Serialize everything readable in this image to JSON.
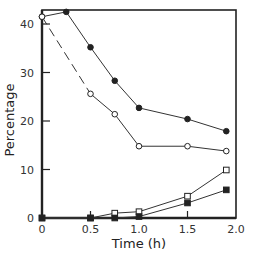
{
  "chart_data": {
    "type": "line",
    "title": "",
    "xlabel": "Time (h)",
    "ylabel": "Percentage",
    "xlim": [
      0,
      2.0
    ],
    "ylim": [
      0,
      43
    ],
    "xticks": [
      0,
      0.5,
      1.0,
      1.5,
      2.0
    ],
    "xtick_labels": [
      "0",
      "0.5",
      "1.0",
      "1.5",
      "2.0"
    ],
    "yticks": [
      0,
      10,
      20,
      30,
      40
    ],
    "ytick_labels": [
      "0",
      "10",
      "20",
      "30",
      "40"
    ],
    "grid": false,
    "legend": null,
    "series": [
      {
        "name": "filled-circles",
        "marker": "filled-circle",
        "line": "solid",
        "x": [
          0,
          0.25,
          0.5,
          0.75,
          1.0,
          1.5,
          1.9
        ],
        "y": [
          41.5,
          42.5,
          35.2,
          28.3,
          22.7,
          20.4,
          17.9
        ]
      },
      {
        "name": "open-circles",
        "marker": "open-circle",
        "line": "dashed-then-solid",
        "dashed_until_x": 0.5,
        "x": [
          0,
          0.5,
          0.75,
          1.0,
          1.5,
          1.9
        ],
        "y": [
          41.5,
          25.6,
          21.4,
          14.8,
          14.8,
          13.8
        ]
      },
      {
        "name": "open-squares",
        "marker": "open-square",
        "line": "solid",
        "x": [
          0,
          0.5,
          0.75,
          1.0,
          1.5,
          1.9
        ],
        "y": [
          0,
          0,
          1.0,
          1.3,
          4.5,
          9.9
        ]
      },
      {
        "name": "filled-squares",
        "marker": "filled-square",
        "line": "solid",
        "x": [
          0,
          0.5,
          0.75,
          1.0,
          1.5,
          1.9
        ],
        "y": [
          0,
          0,
          0,
          0.3,
          3.1,
          5.8
        ]
      }
    ]
  },
  "labels": {
    "xlabel": "Time (h)",
    "ylabel": "Percentage"
  }
}
